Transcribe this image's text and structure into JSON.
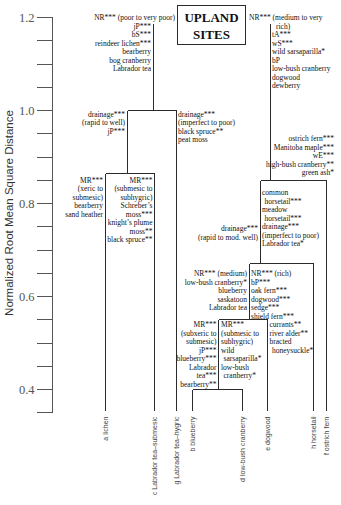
{
  "chart_data": {
    "type": "dendrogram",
    "title": "UPLAND SITES",
    "title_lines": [
      "UPLAND",
      "SITES"
    ],
    "xlabel": "",
    "ylabel": "Normalized Root Mean Square Distance",
    "ylim": [
      0.35,
      1.2
    ],
    "y_major_ticks": [
      1.2,
      1.0,
      0.8,
      0.6,
      0.4
    ],
    "y_tick_labels": [
      "1.2",
      "1.0",
      "0.8",
      "0.6",
      "0.4"
    ],
    "y_minor_step": 0.05,
    "grid": false,
    "leaves": [
      {
        "id": "a",
        "label": "a  lichen"
      },
      {
        "id": "c",
        "label": "c  Labrador tea–submesic"
      },
      {
        "id": "g",
        "label": "g  Labrador tea–hygric"
      },
      {
        "id": "b",
        "label": "b  blueberry"
      },
      {
        "id": "d",
        "label": "d  low-bush cranberry"
      },
      {
        "id": "e",
        "label": "e  dogwood"
      },
      {
        "id": "h",
        "label": "h  horsetail"
      },
      {
        "id": "f",
        "label": "f  ostrich fern"
      }
    ],
    "merges": [
      {
        "id": "a+c",
        "children": [
          "a",
          "c"
        ],
        "height": 0.865
      },
      {
        "id": "a+c+g",
        "children": [
          "a+c",
          "g"
        ],
        "height": 1.0
      },
      {
        "id": "b+d",
        "children": [
          "b",
          "d"
        ],
        "height": 0.4
      },
      {
        "id": "b+d+e",
        "children": [
          "b+d",
          "e"
        ],
        "height": 0.55
      },
      {
        "id": "b+d+e+h",
        "children": [
          "b+d+e",
          "h"
        ],
        "height": 0.67
      },
      {
        "id": "b+d+e+h+f",
        "children": [
          "b+d+e+h",
          "f"
        ],
        "height": 0.85
      },
      {
        "id": "root",
        "children": [
          "a+c+g",
          "b+d+e+h+f"
        ],
        "height": 1.2
      }
    ],
    "annotations": [
      {
        "id": "root-left-head",
        "node": "root",
        "branch": "a+c+g",
        "lines": [
          "NR*** (poor to very poor)"
        ]
      },
      {
        "id": "root-left",
        "node": "root",
        "branch": "a+c+g",
        "lines": [
          "jP***",
          "bS***",
          "reindeer lichen***",
          "bearberry",
          "bog cranberry",
          "Labrador tea"
        ]
      },
      {
        "id": "root-right",
        "node": "root",
        "branch": "b+d+e+h+f",
        "lines": [
          "NR*** (medium to very",
          "rich)",
          "tA***",
          "wS***",
          "wild sarsaparilla*",
          "bP",
          "low-bush cranberry",
          "dogwood",
          "dewberry"
        ]
      },
      {
        "id": "acg-left",
        "node": "a+c+g",
        "branch": "a+c",
        "lines": [
          "drainage***",
          "(rapid to well)",
          "jP***"
        ]
      },
      {
        "id": "acg-right",
        "node": "a+c+g",
        "branch": "g",
        "lines": [
          "drainage***",
          "(imperfect to poor)",
          "black spruce**",
          "peat moss"
        ]
      },
      {
        "id": "ac-left",
        "node": "a+c",
        "branch": "a",
        "lines": [
          "MR***",
          "(xeric to",
          "submesic)",
          "bearberry",
          "sand heather"
        ]
      },
      {
        "id": "ac-right",
        "node": "a+c",
        "branch": "c",
        "lines": [
          "MR***",
          "(submesic to",
          "subhygric)",
          "Schreber’s",
          "moss***",
          "knight’s plume",
          "moss**",
          "black spruce**"
        ]
      },
      {
        "id": "bdehf-right",
        "node": "b+d+e+h+f",
        "branch": "f",
        "lines": [
          "ostrich fern***",
          "Manitoba maple***",
          "wE***",
          "high-bush cranberry**",
          "green ash*"
        ]
      },
      {
        "id": "bdeh-left-upper",
        "node": "b+d+e+h",
        "branch": "b+d+e",
        "lines": [
          "drainage***",
          "(rapid to mod. well)"
        ]
      },
      {
        "id": "bdeh-right-upper",
        "node": "b+d+e+h",
        "branch": "h",
        "lines": [
          "common",
          "horsetail***",
          "meadow",
          "horsetail***",
          "drainage***",
          "(imperfect to poor)",
          "Labrador tea*"
        ]
      },
      {
        "id": "bde-left",
        "node": "b+d+e",
        "branch": "b+d",
        "lines": [
          "NR*** (medium)",
          "low-bush cranberry*",
          "blueberry",
          "saskatoon",
          "Labrador tea"
        ]
      },
      {
        "id": "bde-right",
        "node": "b+d+e",
        "branch": "e",
        "lines": [
          "NR*** (rich)",
          "bP***",
          "oak fern***",
          "dogwood***",
          "sedge***",
          "shield fern***"
        ]
      },
      {
        "id": "bd-left",
        "node": "b+d",
        "branch": "b",
        "lines": [
          "MR***",
          "(subxeric to",
          "submesic)",
          "jP***",
          "blueberry***",
          "Labrador",
          "tea***",
          "bearberry**"
        ]
      },
      {
        "id": "bd-right",
        "node": "b+d",
        "branch": "d",
        "lines": [
          "MR***",
          "(submesic to",
          "subhygric)",
          "wild",
          "sarsaparilla*",
          "low-bush",
          "cranberry*"
        ]
      },
      {
        "id": "bde-right-lower",
        "node": "b+d+e",
        "branch": "e",
        "lines": [
          "currants**",
          "river alder**",
          "bracted",
          "honeysuckle*"
        ]
      }
    ]
  }
}
